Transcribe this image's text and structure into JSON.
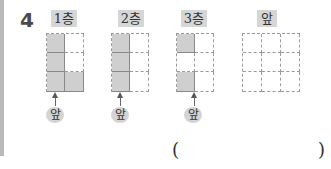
{
  "question": {
    "number": "4"
  },
  "views": [
    {
      "label": "1층",
      "cols": 2,
      "rows": 3,
      "filled": [
        [
          1,
          0
        ],
        [
          1,
          0
        ],
        [
          1,
          1
        ]
      ],
      "front_label": "앞"
    },
    {
      "label": "2층",
      "cols": 2,
      "rows": 3,
      "filled": [
        [
          1,
          0
        ],
        [
          1,
          0
        ],
        [
          1,
          0
        ]
      ],
      "front_label": "앞"
    },
    {
      "label": "3층",
      "cols": 2,
      "rows": 3,
      "filled": [
        [
          1,
          0
        ],
        [
          0,
          0
        ],
        [
          1,
          0
        ]
      ],
      "front_label": "앞"
    },
    {
      "label": "앞",
      "cols": 3,
      "rows": 3,
      "filled": [
        [
          0,
          0,
          0
        ],
        [
          0,
          0,
          0
        ],
        [
          0,
          0,
          0
        ]
      ]
    }
  ],
  "answer": {
    "open_paren": "(",
    "close_paren": ")",
    "value": ""
  },
  "colors": {
    "filled_cell": "#cfcfcf",
    "badge_bg": "#d6d6d6",
    "side_bar": "#b9b9b9"
  }
}
